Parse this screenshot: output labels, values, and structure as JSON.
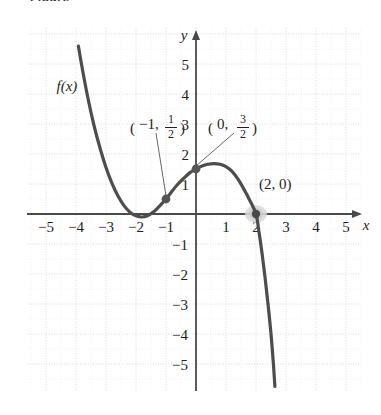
{
  "caption_fragment": "Figure",
  "chart_data": {
    "type": "line",
    "title": "",
    "xlabel": "x",
    "ylabel": "y",
    "grid": true,
    "legend": null,
    "xlim": [
      -5.6,
      5.6
    ],
    "ylim": [
      -5.8,
      5.6
    ],
    "xticks": [
      -5,
      -4,
      -3,
      -2,
      -1,
      1,
      2,
      3,
      4,
      5
    ],
    "yticks": [
      5,
      4,
      3,
      2,
      1,
      -1,
      -2,
      -3,
      -4,
      -5
    ],
    "xtick_labels": [
      "-5",
      "-4",
      "-3",
      "-2",
      "-1",
      "1",
      "2",
      "3",
      "4",
      "5"
    ],
    "ytick_labels": [
      "5",
      "4",
      "3",
      "2",
      "1",
      "-1",
      "-2",
      "-3",
      "-4",
      "-5"
    ],
    "curve_label": "f(x)",
    "series": [
      {
        "name": "f(x)",
        "description": "cubic with local minimum near x = -1.8 and local maximum near x = 0.8, crossing the x-axis at x = 2",
        "points": [
          [
            -3.92,
            5.6
          ],
          [
            -3.8,
            4.9
          ],
          [
            -3.6,
            3.85
          ],
          [
            -3.4,
            2.95
          ],
          [
            -3.2,
            2.2
          ],
          [
            -3.0,
            1.55
          ],
          [
            -2.8,
            1.02
          ],
          [
            -2.6,
            0.6
          ],
          [
            -2.4,
            0.28
          ],
          [
            -2.2,
            0.06
          ],
          [
            -2.0,
            -0.06
          ],
          [
            -1.8,
            -0.1
          ],
          [
            -1.6,
            -0.05
          ],
          [
            -1.4,
            0.08
          ],
          [
            -1.2,
            0.28
          ],
          [
            -1.0,
            0.5
          ],
          [
            -0.8,
            0.76
          ],
          [
            -0.6,
            1.0
          ],
          [
            -0.4,
            1.2
          ],
          [
            -0.2,
            1.38
          ],
          [
            0.0,
            1.5
          ],
          [
            0.2,
            1.6
          ],
          [
            0.4,
            1.66
          ],
          [
            0.6,
            1.68
          ],
          [
            0.8,
            1.66
          ],
          [
            1.0,
            1.58
          ],
          [
            1.2,
            1.42
          ],
          [
            1.4,
            1.16
          ],
          [
            1.6,
            0.82
          ],
          [
            1.8,
            0.44
          ],
          [
            2.0,
            0.0
          ],
          [
            2.1,
            -0.6
          ],
          [
            2.2,
            -1.3
          ],
          [
            2.3,
            -2.1
          ],
          [
            2.4,
            -3.0
          ],
          [
            2.5,
            -4.0
          ],
          [
            2.58,
            -5.0
          ],
          [
            2.63,
            -5.75
          ]
        ]
      }
    ],
    "marked_points": [
      {
        "x": -1,
        "y": 0.5,
        "label_whole": "-1",
        "label_num": "1",
        "label_den": "2",
        "style": "solid-dot"
      },
      {
        "x": 0,
        "y": 1.5,
        "label_whole": "0",
        "label_num": "3",
        "label_den": "2",
        "style": "solid-dot"
      },
      {
        "x": 2,
        "y": 0,
        "label_plain": "(2, 0)",
        "style": "highlighted-dot"
      }
    ],
    "annotations": [
      {
        "text": "f(x)",
        "x": -4.65,
        "y": 4.1,
        "italic": true
      },
      {
        "text": "(-1, 1/2)",
        "x": -2.2,
        "y": 2.9,
        "leader_to": [
          -1,
          0.5
        ]
      },
      {
        "text": "(0, 3/2)",
        "x": 0.4,
        "y": 2.9,
        "leader_to": [
          0,
          1.5
        ]
      },
      {
        "text": "(2, 0)",
        "x": 2.1,
        "y": 0.85
      }
    ]
  },
  "colors": {
    "curve": "#4d4d4d",
    "axis": "#4a4a4a",
    "grid": "#d9d9e0",
    "text": "#231f20",
    "marker": "#555555",
    "highlight": "#d8d8d8"
  }
}
